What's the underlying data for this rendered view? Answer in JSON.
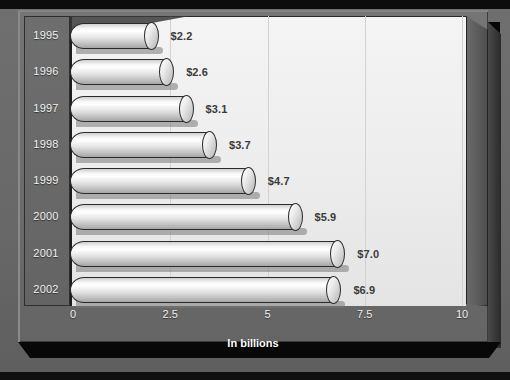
{
  "chart_data": {
    "type": "bar",
    "orientation": "horizontal",
    "style": "3d-cylinder",
    "title": "",
    "subtitle": "",
    "xlabel": "In billions",
    "ylabel": "",
    "categories": [
      "1995",
      "1996",
      "1997",
      "1998",
      "1999",
      "2000",
      "2001",
      "2002"
    ],
    "values": [
      2.2,
      2.6,
      3.1,
      3.7,
      4.7,
      5.9,
      7.0,
      6.9
    ],
    "data_labels": [
      "$2.2",
      "$2.6",
      "$3.1",
      "$3.7",
      "$4.7",
      "$5.9",
      "$7.0",
      "$6.9"
    ],
    "xlim": [
      0,
      10
    ],
    "xticks": [
      "0",
      "2.5",
      "5",
      "7.5",
      "10"
    ],
    "xtick_values": [
      0,
      2.5,
      5,
      7.5,
      10
    ],
    "grid": "vertical",
    "legend": "none",
    "colors": {
      "background": "#6b6b6b",
      "plot_area": "#efefef",
      "bar_light": "#ffffff",
      "bar_dark": "#a6a6a6",
      "bar_outline": "#2b2b2b",
      "value_label": "#3b3b3b",
      "category_label": "#f2f2f2",
      "tick_label": "#f0f0f0",
      "axis_title": "#ffffff",
      "gridline": "#d2d2d2"
    }
  }
}
